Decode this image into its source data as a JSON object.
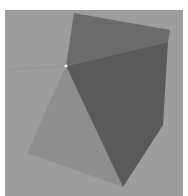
{
  "scene": {
    "background_color": "#ffffff",
    "panel": {
      "x": 5,
      "y": 10,
      "width": 178,
      "height": 186,
      "color": "#9d9d9d"
    },
    "faint_line": {
      "points": "5,70 66,66",
      "color": "#959595"
    },
    "shapes": [
      {
        "name": "light-triangle",
        "points": "66,66 27,153 123,187",
        "color": "#8e8e8e"
      },
      {
        "name": "top-quad",
        "points": "74,13 170,30 168,42 66,66",
        "color": "#6b6b6b"
      },
      {
        "name": "dark-pentagon",
        "points": "66,66 168,42 163,125 123,187",
        "color": "#5a5a5a"
      }
    ],
    "dot": {
      "cx": 66,
      "cy": 66,
      "r": 1.6,
      "color": "#f2f2f2"
    }
  }
}
